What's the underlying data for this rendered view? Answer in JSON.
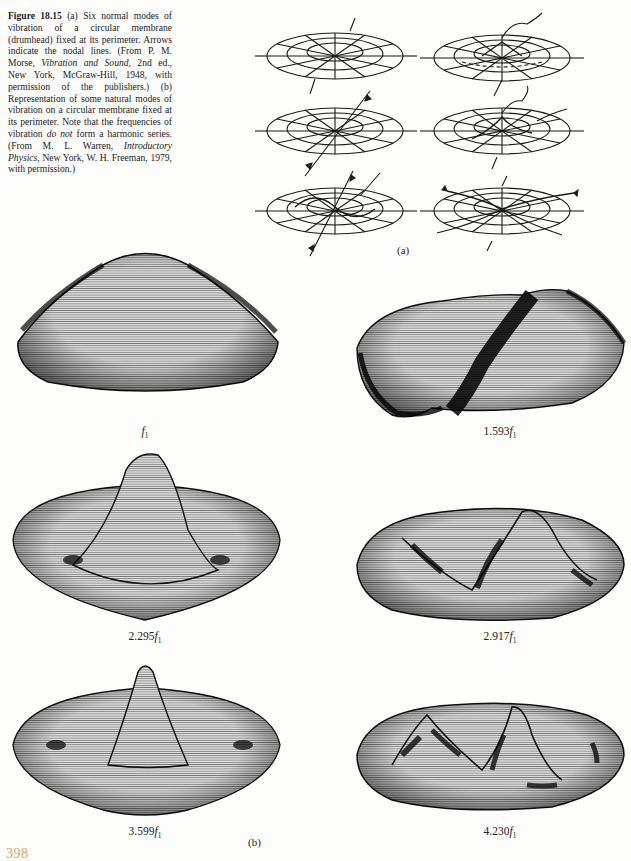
{
  "caption": {
    "figure_label": "Figure 18.15",
    "part_a_marker": "(a)",
    "part_a_text": "Six normal modes of vibration of a circular membrane (drumhead) fixed at its perimeter. Arrows indicate the nodal lines. (From P. M. Morse, ",
    "part_a_book": "Vibration and Sound",
    "part_a_tail": ", 2nd ed., New York, McGraw-Hill, 1948, with permission of the publishers.)",
    "part_b_marker": "(b)",
    "part_b_text": "Representation of some natural modes of vibration on a circular membrane fixed at its perimeter. Note that the frequencies of vibration ",
    "part_b_emph": "do not",
    "part_b_text2": " form a harmonic series. (From M. L. Warren, ",
    "part_b_book": "Introductory Physics",
    "part_b_tail": ", New York, W. H. Freeman, 1979, with permission.)"
  },
  "panel_a": {
    "label": "(a)",
    "modes": [
      {
        "row": 1,
        "col": 1,
        "description": "fundamental mode, single nodal circle at rim"
      },
      {
        "row": 1,
        "col": 2,
        "description": "mode with one nodal circle inside"
      },
      {
        "row": 2,
        "col": 1,
        "description": "mode with one nodal diameter"
      },
      {
        "row": 2,
        "col": 2,
        "description": "mode with nodal diameter and nodal circle"
      },
      {
        "row": 3,
        "col": 1,
        "description": "mode with two nodal diameters"
      },
      {
        "row": 3,
        "col": 2,
        "description": "mode with nodal diameters and circle"
      }
    ]
  },
  "panel_b": {
    "label": "(b)",
    "surfaces": [
      {
        "freq_coeff": "",
        "freq_symbol": "f",
        "freq_sub": "1"
      },
      {
        "freq_coeff": "1.593",
        "freq_symbol": "f",
        "freq_sub": "1"
      },
      {
        "freq_coeff": "2.295",
        "freq_symbol": "f",
        "freq_sub": "1"
      },
      {
        "freq_coeff": "2.917",
        "freq_symbol": "f",
        "freq_sub": "1"
      },
      {
        "freq_coeff": "3.599",
        "freq_symbol": "f",
        "freq_sub": "1"
      },
      {
        "freq_coeff": "4.230",
        "freq_symbol": "f",
        "freq_sub": "1"
      }
    ]
  },
  "page": {
    "number": "398",
    "number_color": "#d7a46a"
  }
}
